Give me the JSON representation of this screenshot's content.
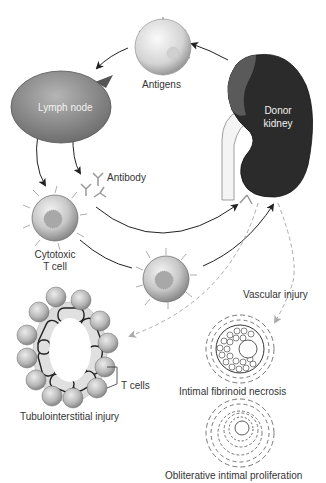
{
  "diagram": {
    "nodes": {
      "antigens": "Antigens",
      "lymph_node": "Lymph node",
      "donor_kidney_line1": "Donor",
      "donor_kidney_line2": "kidney",
      "antibody": "Antibody",
      "cytotoxic_line1": "Cytotoxic",
      "cytotoxic_line2": "T cell",
      "vascular_injury": "Vascular injury",
      "t_cells": "T cells",
      "tubulointerstitial": "Tubulointerstitial injury",
      "intimal_fibrinoid": "Intimal fibrinoid necrosis",
      "obliterative": "Obliterative intimal proliferation"
    },
    "colors": {
      "kidney": "#2b2b2b",
      "lymph_node": "#8c8c8c",
      "cell": "#bdbdbd",
      "arrow": "#222222",
      "dashed_arrow": "#aaaaaa"
    }
  }
}
